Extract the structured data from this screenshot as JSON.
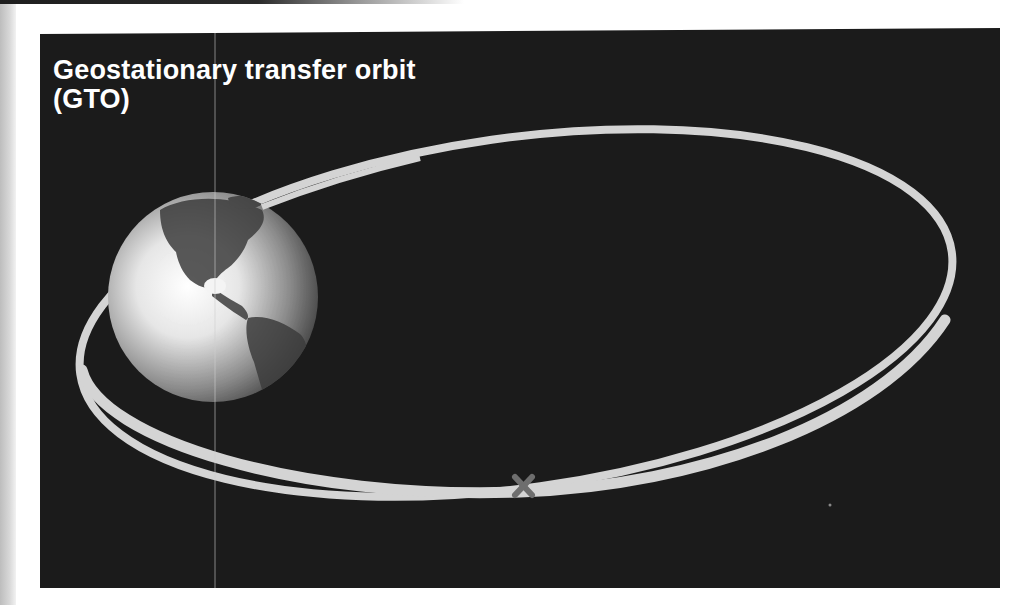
{
  "diagram": {
    "title_line1": "Geostationary transfer orbit",
    "title_line2": "(GTO)",
    "elements": {
      "earth": "globe showing North and South America",
      "orbit": "elliptical transfer orbit",
      "marker": "x-marker on orbit at apogee/perigee point"
    },
    "colors": {
      "background": "#1b1b1b",
      "orbit": "#d4d4d4",
      "marker": "#6e6e6e",
      "title": "#ffffff"
    }
  }
}
